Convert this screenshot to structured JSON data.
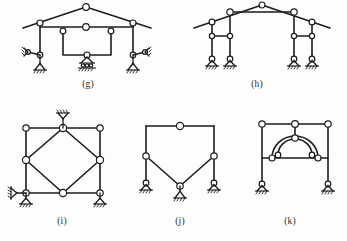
{
  "sheet": {
    "title": "Structural frame stability and determinacy figures",
    "background_color": "#fdfdfd",
    "line_color": "#1c1c1c",
    "node_fill_color": "#ffffff",
    "width": 347,
    "height": 241
  },
  "figures": [
    {
      "id": "g",
      "caption": "(g)",
      "description": "Gable roof frame with interior rectangular sub-frame, pin and roller supports",
      "node_count": 10,
      "support_types": [
        "roller",
        "pin",
        "pin",
        "roller",
        "roller"
      ],
      "hinge_symbol": "open-circle"
    },
    {
      "id": "h",
      "caption": "(h)",
      "description": "Gable roof frame on four columns with two horizontal tie beams, four pin supports",
      "node_count": 11,
      "support_types": [
        "pin",
        "pin",
        "pin",
        "pin"
      ],
      "hinge_symbol": "open-circle"
    },
    {
      "id": "i",
      "caption": "(i)",
      "description": "Square frame with inscribed diamond bracing, roller and pin supports",
      "node_count": 8,
      "support_types": [
        "roller",
        "roller",
        "roller"
      ],
      "hinge_symbol": "open-circle"
    },
    {
      "id": "j",
      "caption": "(j)",
      "description": "Portal frame with V-shaped inverted truss legs, three supports",
      "node_count": 6,
      "support_types": [
        "roller",
        "roller",
        "roller"
      ],
      "hinge_symbol": "open-circle"
    },
    {
      "id": "k",
      "caption": "(k)",
      "description": "Portal frame with internal semicircular arch ring and hanger, two pin supports",
      "node_count": 9,
      "support_types": [
        "pin",
        "pin"
      ],
      "hinge_symbol": "open-circle"
    }
  ],
  "legend": {
    "open_circle_meaning": "internal hinge / pin connection",
    "triangle_with_hatch_meaning": "support on ground"
  }
}
